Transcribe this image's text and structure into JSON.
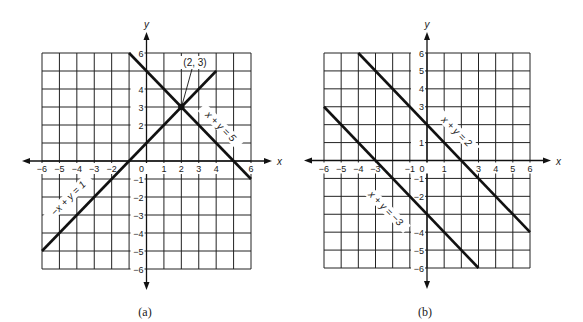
{
  "figure": {
    "captions": {
      "a": "(a)",
      "b": "(b)"
    }
  },
  "chart_data": [
    {
      "type": "line",
      "panel": "(a)",
      "title": "",
      "xlabel": "x",
      "ylabel": "y",
      "xlim": [
        -6,
        6
      ],
      "ylim": [
        -6,
        6
      ],
      "grid": true,
      "x_tick_labels": [
        "-6",
        "-5",
        "-4",
        "-3",
        "-2",
        "0",
        "1",
        "2",
        "3",
        "4",
        "6"
      ],
      "x_tick_values": [
        -6,
        -5,
        -4,
        -3,
        -2,
        0,
        1,
        2,
        3,
        4,
        6
      ],
      "y_tick_labels": [
        "6",
        "4",
        "3",
        "2",
        "-1",
        "-2",
        "-3",
        "-4",
        "-5",
        "-6"
      ],
      "y_tick_values": [
        6,
        4,
        3,
        2,
        -1,
        -2,
        -3,
        -4,
        -5,
        -6
      ],
      "series": [
        {
          "name": "x + y = 5",
          "equation": "x + y = 5",
          "points": [
            [
              -1,
              6
            ],
            [
              6,
              -1
            ]
          ],
          "label_text": "x + y = 5"
        },
        {
          "name": "−x + y = 1",
          "equation": "-x + y = 1",
          "points": [
            [
              -6,
              -5
            ],
            [
              4,
              5
            ]
          ],
          "label_text": "−x + y = 1"
        }
      ],
      "annotations": [
        {
          "text": "(2, 3)",
          "point": [
            2,
            3
          ],
          "note": "intersection point"
        }
      ]
    },
    {
      "type": "line",
      "panel": "(b)",
      "title": "",
      "xlabel": "x",
      "ylabel": "y",
      "xlim": [
        -6,
        6
      ],
      "ylim": [
        -6,
        6
      ],
      "grid": true,
      "x_tick_labels": [
        "-6",
        "-5",
        "-4",
        "-3",
        "-1",
        "0",
        "1",
        "3",
        "4",
        "5",
        "6"
      ],
      "x_tick_values": [
        -6,
        -5,
        -4,
        -3,
        -1,
        0,
        1,
        3,
        4,
        5,
        6
      ],
      "y_tick_labels": [
        "6",
        "5",
        "4",
        "3",
        "1",
        "-1",
        "-2",
        "-4",
        "-5",
        "-6"
      ],
      "y_tick_values": [
        6,
        5,
        4,
        3,
        1,
        -1,
        -2,
        -4,
        -5,
        -6
      ],
      "series": [
        {
          "name": "x + y = 2",
          "equation": "x + y = 2",
          "points": [
            [
              -4,
              6
            ],
            [
              6,
              -4
            ]
          ],
          "label_text": "x + y = 2"
        },
        {
          "name": "x + y = −3",
          "equation": "x + y = -3",
          "points": [
            [
              -6,
              3
            ],
            [
              3,
              -6
            ]
          ],
          "label_text": "x + y = −3"
        }
      ],
      "annotations": []
    }
  ]
}
